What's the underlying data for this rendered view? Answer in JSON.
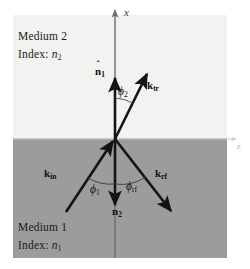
{
  "figure": {
    "width": 250,
    "height": 269
  },
  "media": {
    "upper": {
      "name_label": "Medium 2",
      "index_prefix": "Index:",
      "index_symbol": "n",
      "index_subscript": "2",
      "color": "#f2f2f0"
    },
    "lower": {
      "name_label": "Medium 1",
      "index_prefix": "Index:",
      "index_symbol": "n",
      "index_subscript": "1",
      "color": "#9c9c9c"
    }
  },
  "axes": {
    "vertical": {
      "label": "x",
      "color": "#6e6e6e"
    },
    "horizontal": {
      "label": "z",
      "color": "#c9c9c9"
    }
  },
  "vectors": {
    "normal_up": {
      "symbol": "n",
      "subscript": "1",
      "hat": "ˆ",
      "description": "unit normal into medium 2"
    },
    "normal_down": {
      "symbol": "n",
      "subscript": "2",
      "hat": "ˆ",
      "description": "unit normal into medium 1"
    },
    "incident": {
      "symbol": "k",
      "subscript": "in",
      "description": "incident wave vector"
    },
    "reflected": {
      "symbol": "k",
      "subscript": "rf",
      "description": "reflected wave vector"
    },
    "transmitted": {
      "symbol": "k",
      "subscript": "tr",
      "description": "transmitted wave vector"
    }
  },
  "angles": {
    "transmission": {
      "symbol": "ϕ",
      "subscript": "2",
      "description": "transmission angle from normal"
    },
    "incidence": {
      "symbol": "ϕ",
      "subscript": "1",
      "description": "incidence angle from normal"
    },
    "reflection": {
      "symbol": "ϕ",
      "subscript": "rf",
      "description": "reflection angle from normal"
    }
  },
  "geometry": {
    "origin_x": 115,
    "origin_y": 139,
    "interface_y": 139,
    "arrow_color": "#141414"
  }
}
